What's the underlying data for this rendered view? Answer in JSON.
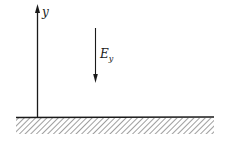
{
  "diagram": {
    "axis": {
      "label": "y",
      "direction": "up"
    },
    "field_arrow": {
      "label_main": "E",
      "label_sub": "y",
      "direction": "down"
    },
    "ground": {
      "style": "hatched"
    },
    "colors": {
      "stroke": "#1a1a1a",
      "background": "#ffffff"
    }
  }
}
